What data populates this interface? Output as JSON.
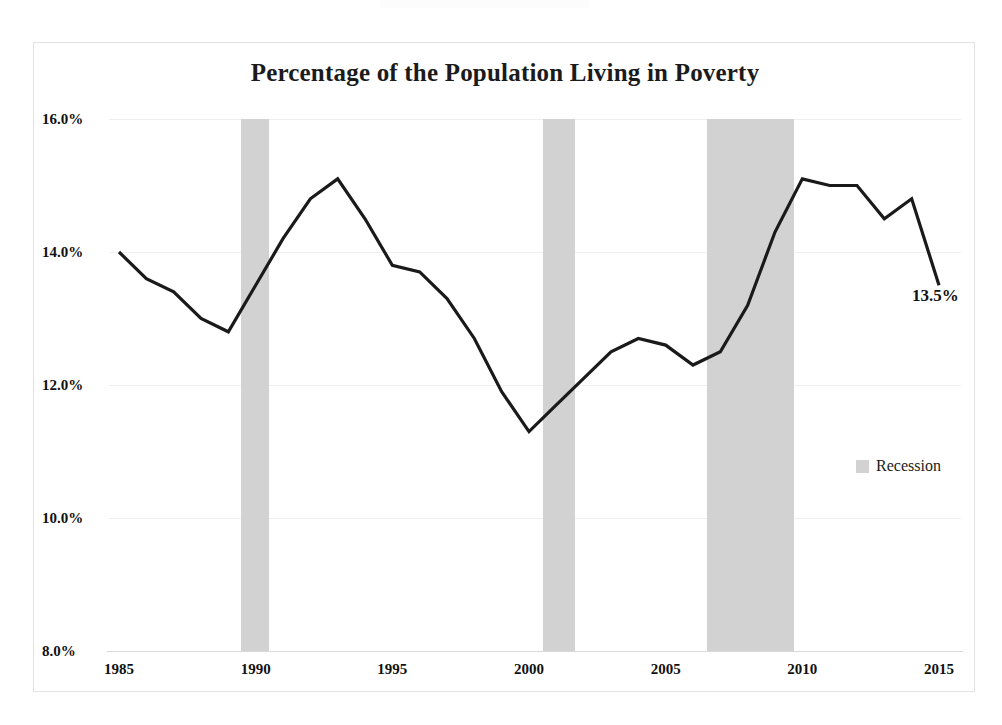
{
  "page": {
    "top_artifact_note": ""
  },
  "chart": {
    "title": "Percentage of the Population Living in Poverty",
    "end_label": "13.5%",
    "legend": {
      "label": "Recession",
      "swatch_color": "#d2d2d2"
    },
    "frame_color": "#e2e2e4",
    "line_color": "#1a1a1a",
    "grid_color": "#efefef"
  },
  "chart_data": {
    "type": "line",
    "title": "Percentage of the Population Living in Poverty",
    "xlabel": "",
    "ylabel": "",
    "xlim": [
      1985,
      2015
    ],
    "ylim": [
      8.0,
      16.0
    ],
    "grid": true,
    "legend_position": "right-middle",
    "xticks": [
      "1985",
      "1990",
      "1995",
      "2000",
      "2005",
      "2010",
      "2015"
    ],
    "xtick_values": [
      1985,
      1990,
      1995,
      2000,
      2005,
      2010,
      2015
    ],
    "yticks": [
      "8.0%",
      "10.0%",
      "12.0%",
      "14.0%",
      "16.0%"
    ],
    "ytick_values": [
      8.0,
      10.0,
      12.0,
      14.0,
      16.0
    ],
    "x": [
      1985,
      1986,
      1987,
      1988,
      1989,
      1990,
      1991,
      1992,
      1993,
      1994,
      1995,
      1996,
      1997,
      1998,
      1999,
      2000,
      2001,
      2002,
      2003,
      2004,
      2005,
      2006,
      2007,
      2008,
      2009,
      2010,
      2011,
      2012,
      2013,
      2014,
      2015
    ],
    "series": [
      {
        "name": "Poverty rate",
        "values": [
          14.0,
          13.6,
          13.4,
          13.0,
          12.8,
          13.5,
          14.2,
          14.8,
          15.1,
          14.5,
          13.8,
          13.7,
          13.3,
          12.7,
          11.9,
          11.3,
          11.7,
          12.1,
          12.5,
          12.7,
          12.6,
          12.3,
          12.5,
          13.2,
          14.3,
          15.1,
          15.0,
          15.0,
          14.5,
          14.8,
          13.5
        ]
      }
    ],
    "annotations": [
      {
        "text": "13.5%",
        "x": 2015,
        "y": 13.5
      }
    ],
    "shaded_regions": [
      {
        "label": "Recession",
        "x_start": 1989.45,
        "x_end": 1990.5,
        "color": "#d2d2d2"
      },
      {
        "label": "Recession",
        "x_start": 2000.5,
        "x_end": 2001.7,
        "color": "#d2d2d2"
      },
      {
        "label": "Recession",
        "x_start": 2006.5,
        "x_end": 2009.7,
        "color": "#d2d2d2"
      }
    ]
  }
}
